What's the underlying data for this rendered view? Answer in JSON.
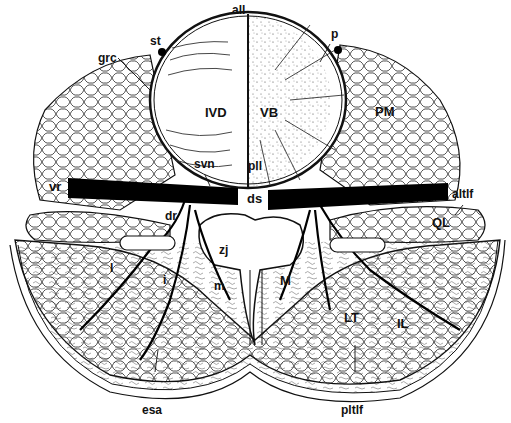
{
  "figure": {
    "type": "anatomical cross-section line drawing",
    "colors": {
      "ink": "#111111",
      "background": "#ffffff",
      "stipple": "#555555"
    },
    "labels": {
      "all": "all",
      "st": "st",
      "p": "p",
      "grc": "grc",
      "ivd": "IVD",
      "vb": "VB",
      "pm": "PM",
      "svn": "svn",
      "pll": "pll",
      "vr": "vr",
      "ds": "ds",
      "altlf": "altlf",
      "dr": "dr",
      "ql": "QL",
      "zj": "zj",
      "l": "l",
      "i": "i",
      "m": "m",
      "M": "M",
      "lt": "LT",
      "il": "IL",
      "esa": "esa",
      "pltlf": "pltlf"
    }
  }
}
